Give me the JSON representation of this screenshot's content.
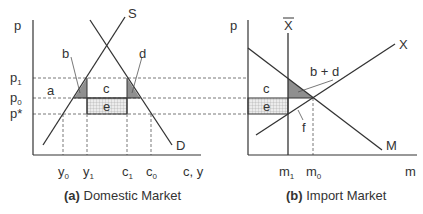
{
  "panel_a": {
    "caption_prefix": "(a)",
    "caption_text": " Domestic Market",
    "y_axis_label": "p",
    "x_axis_label": "c, y",
    "curve_supply": "S",
    "curve_demand": "D",
    "price_levels": [
      {
        "base": "p",
        "sub": "1"
      },
      {
        "base": "p",
        "sub": "0"
      },
      {
        "base": "p*",
        "sub": ""
      }
    ],
    "quantity_ticks": [
      {
        "base": "y",
        "sub": "0"
      },
      {
        "base": "y",
        "sub": "1"
      },
      {
        "base": "c",
        "sub": "1"
      },
      {
        "base": "c",
        "sub": "0"
      }
    ],
    "areas": {
      "a": "a",
      "b": "b",
      "c": "c",
      "d": "d",
      "e": "e"
    }
  },
  "panel_b": {
    "caption_prefix": "(b)",
    "caption_text": " Import Market",
    "y_axis_label": "p",
    "x_axis_label": "m",
    "quota_label": "X",
    "curve_export": "X",
    "curve_import": "M",
    "quantity_ticks": [
      {
        "base": "m",
        "sub": "1"
      },
      {
        "base": "m",
        "sub": "0"
      }
    ],
    "areas": {
      "c": "c",
      "e": "e",
      "bd": "b + d",
      "f": "f"
    }
  },
  "colors": {
    "line": "#333333",
    "dash": "#555555",
    "shade_dark": "#8a8a8a",
    "grid_fill": "#e6e6e6"
  }
}
